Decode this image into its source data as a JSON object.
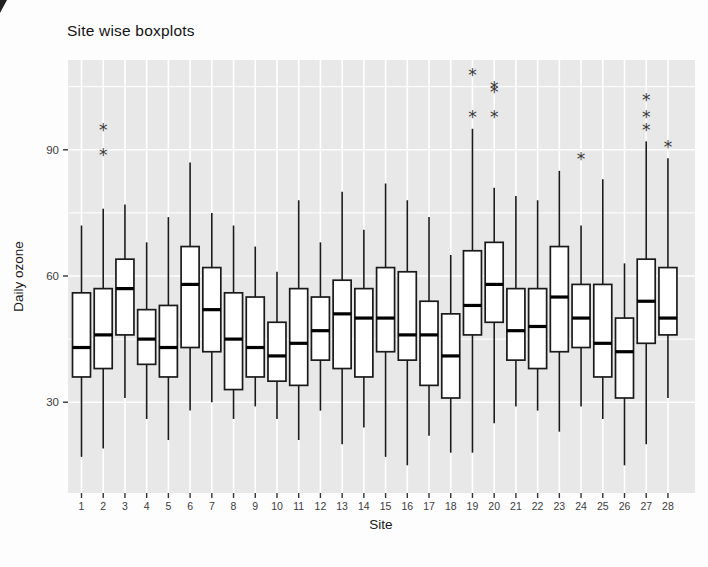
{
  "title": "Site wise boxplots",
  "axes": {
    "x_label": "Site",
    "y_label": "Daily ozone"
  },
  "colors": {
    "panel_bg": "#e8e8e8",
    "grid": "#ffffff",
    "box_fill": "#ffffff",
    "box_stroke": "#1a1a1a",
    "median": "#000000",
    "outlier": "#3a3a3a",
    "tick_label": "#3c3c3c",
    "tick_mark": "#333333"
  },
  "chart_data": {
    "type": "boxplot",
    "title": "Site wise boxplots",
    "xlabel": "Site",
    "ylabel": "Daily ozone",
    "ylim": [
      8.5,
      111.5
    ],
    "y_major_ticks": [
      30,
      60,
      90
    ],
    "y_minor_gridlines": [
      45,
      75,
      105
    ],
    "grid": "on",
    "categories": [
      "1",
      "2",
      "3",
      "4",
      "5",
      "6",
      "7",
      "8",
      "9",
      "10",
      "11",
      "12",
      "13",
      "14",
      "15",
      "16",
      "17",
      "18",
      "19",
      "20",
      "21",
      "22",
      "23",
      "24",
      "25",
      "26",
      "27",
      "28"
    ],
    "boxes": [
      {
        "site": "1",
        "low": 17,
        "q1": 36,
        "median": 43,
        "q3": 56,
        "high": 72,
        "outliers": []
      },
      {
        "site": "2",
        "low": 19,
        "q1": 38,
        "median": 46,
        "q3": 57,
        "high": 76,
        "outliers": [
          89,
          95
        ]
      },
      {
        "site": "3",
        "low": 31,
        "q1": 46,
        "median": 57,
        "q3": 64,
        "high": 77,
        "outliers": []
      },
      {
        "site": "4",
        "low": 26,
        "q1": 39,
        "median": 45,
        "q3": 52,
        "high": 68,
        "outliers": []
      },
      {
        "site": "5",
        "low": 21,
        "q1": 36,
        "median": 43,
        "q3": 53,
        "high": 74,
        "outliers": []
      },
      {
        "site": "6",
        "low": 28,
        "q1": 43,
        "median": 58,
        "q3": 67,
        "high": 87,
        "outliers": []
      },
      {
        "site": "7",
        "low": 30,
        "q1": 42,
        "median": 52,
        "q3": 62,
        "high": 75,
        "outliers": []
      },
      {
        "site": "8",
        "low": 26,
        "q1": 33,
        "median": 45,
        "q3": 56,
        "high": 72,
        "outliers": []
      },
      {
        "site": "9",
        "low": 29,
        "q1": 36,
        "median": 43,
        "q3": 55,
        "high": 67,
        "outliers": []
      },
      {
        "site": "10",
        "low": 26,
        "q1": 35,
        "median": 41,
        "q3": 49,
        "high": 61,
        "outliers": []
      },
      {
        "site": "11",
        "low": 21,
        "q1": 34,
        "median": 44,
        "q3": 57,
        "high": 78,
        "outliers": []
      },
      {
        "site": "12",
        "low": 28,
        "q1": 40,
        "median": 47,
        "q3": 55,
        "high": 68,
        "outliers": []
      },
      {
        "site": "13",
        "low": 20,
        "q1": 38,
        "median": 51,
        "q3": 59,
        "high": 80,
        "outliers": []
      },
      {
        "site": "14",
        "low": 24,
        "q1": 36,
        "median": 50,
        "q3": 57,
        "high": 71,
        "outliers": []
      },
      {
        "site": "15",
        "low": 17,
        "q1": 42,
        "median": 50,
        "q3": 62,
        "high": 82,
        "outliers": []
      },
      {
        "site": "16",
        "low": 15,
        "q1": 40,
        "median": 46,
        "q3": 61,
        "high": 78,
        "outliers": []
      },
      {
        "site": "17",
        "low": 22,
        "q1": 34,
        "median": 46,
        "q3": 54,
        "high": 74,
        "outliers": []
      },
      {
        "site": "18",
        "low": 18,
        "q1": 31,
        "median": 41,
        "q3": 51,
        "high": 65,
        "outliers": []
      },
      {
        "site": "19",
        "low": 18,
        "q1": 46,
        "median": 53,
        "q3": 66,
        "high": 95,
        "outliers": [
          98,
          108
        ]
      },
      {
        "site": "20",
        "low": 25,
        "q1": 49,
        "median": 58,
        "q3": 68,
        "high": 81,
        "outliers": [
          98,
          104,
          105
        ]
      },
      {
        "site": "21",
        "low": 29,
        "q1": 40,
        "median": 47,
        "q3": 57,
        "high": 79,
        "outliers": []
      },
      {
        "site": "22",
        "low": 28,
        "q1": 38,
        "median": 48,
        "q3": 57,
        "high": 78,
        "outliers": []
      },
      {
        "site": "23",
        "low": 23,
        "q1": 42,
        "median": 55,
        "q3": 67,
        "high": 85,
        "outliers": []
      },
      {
        "site": "24",
        "low": 29,
        "q1": 43,
        "median": 50,
        "q3": 58,
        "high": 72,
        "outliers": [
          88
        ]
      },
      {
        "site": "25",
        "low": 26,
        "q1": 36,
        "median": 44,
        "q3": 58,
        "high": 83,
        "outliers": []
      },
      {
        "site": "26",
        "low": 15,
        "q1": 31,
        "median": 42,
        "q3": 50,
        "high": 63,
        "outliers": []
      },
      {
        "site": "27",
        "low": 20,
        "q1": 44,
        "median": 54,
        "q3": 64,
        "high": 92,
        "outliers": [
          95,
          98,
          102
        ]
      },
      {
        "site": "28",
        "low": 31,
        "q1": 46,
        "median": 50,
        "q3": 62,
        "high": 88,
        "outliers": [
          91
        ]
      }
    ]
  }
}
